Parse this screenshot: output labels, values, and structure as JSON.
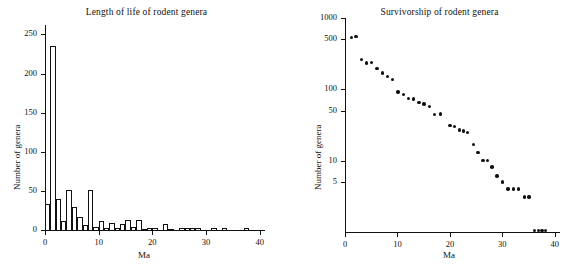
{
  "figure": {
    "background": "#ffffff",
    "ink": "#111111"
  },
  "chart_data": [
    {
      "type": "bar",
      "panel": "left",
      "title": "Length of life of rodent genera",
      "xlabel": "Ma",
      "ylabel": "Number of genera",
      "xlim": [
        0,
        41
      ],
      "ylim": [
        0,
        262
      ],
      "xticks": [
        0,
        10,
        20,
        30,
        40
      ],
      "xticklabels": [
        "0",
        "10",
        "20",
        "30",
        "40"
      ],
      "yticks": [
        0,
        50,
        100,
        150,
        200,
        250
      ],
      "yticklabels": [
        "0",
        "50",
        "100",
        "150",
        "200",
        "250"
      ],
      "grid": false,
      "bar_width": 1,
      "categories": [
        0.5,
        1.5,
        2.5,
        3.5,
        4.5,
        5.5,
        6.5,
        7.5,
        8.5,
        9.5,
        10.5,
        11.5,
        12.5,
        13.5,
        14.5,
        15.5,
        16.5,
        17.5,
        18.5,
        19.5,
        20.5,
        21.5,
        22.5,
        23.5,
        24.5,
        25.5,
        26.5,
        27.5,
        28.5,
        29.5,
        30.5,
        31.5,
        32.5,
        33.5,
        34.5,
        35.5,
        36.5,
        37.5,
        38.5,
        39.5
      ],
      "values": [
        33,
        235,
        39,
        12,
        51,
        29,
        17,
        7,
        51,
        4,
        11,
        3,
        9,
        2,
        8,
        13,
        4,
        13,
        1,
        3,
        2,
        0,
        8,
        1,
        0,
        3,
        3,
        3,
        2,
        0,
        0,
        2,
        0,
        2,
        0,
        0,
        0,
        2,
        0,
        0
      ]
    },
    {
      "type": "scatter",
      "panel": "right",
      "title": "Survivorship of rodent genera",
      "xlabel": "Ma",
      "ylabel": "Number of genera",
      "xlim": [
        0,
        41
      ],
      "yscale": "log",
      "ylim": [
        1,
        1000
      ],
      "xticks": [
        0,
        10,
        20,
        30,
        40
      ],
      "xticklabels": [
        "0",
        "10",
        "20",
        "30",
        "40"
      ],
      "yticks": [
        5,
        10,
        50,
        100,
        500,
        1000
      ],
      "yticklabels": [
        "5",
        "10",
        "50",
        "100",
        "500",
        "1000"
      ],
      "grid": false,
      "x": [
        1.2,
        2.1,
        3.1,
        4.1,
        5.1,
        6.1,
        7.1,
        8.1,
        9.1,
        10.1,
        11.1,
        12.1,
        13.1,
        14.1,
        15.1,
        16.1,
        17.1,
        18.2,
        20.0,
        20.9,
        21.8,
        22.6,
        23.4,
        24.5,
        25.4,
        26.3,
        27.2,
        28.0,
        29.0,
        30.0,
        31.1,
        32.1,
        33.1,
        34.2,
        35.1,
        36.1,
        36.9,
        37.6,
        38.2
      ],
      "y": [
        530,
        545,
        260,
        235,
        240,
        195,
        170,
        152,
        138,
        92,
        84,
        75,
        73,
        66,
        62,
        57,
        44,
        45,
        31,
        30,
        27,
        26,
        25,
        17,
        13,
        10,
        10,
        8.2,
        6.1,
        5.0,
        4.0,
        4.0,
        4.0,
        3.1,
        3.1,
        1.05,
        1.05,
        1.05,
        1.05
      ]
    }
  ]
}
